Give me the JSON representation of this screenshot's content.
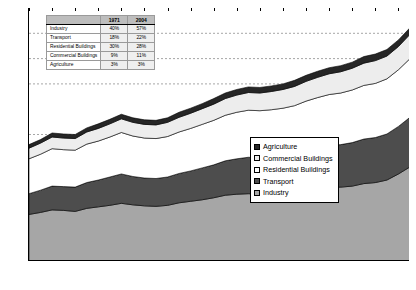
{
  "chart_data": {
    "type": "area",
    "title": "",
    "xlabel": "",
    "ylabel": "Primary Energy (EJ)",
    "ylim": [
      0,
      500
    ],
    "ytick_step": 50,
    "yticks": [
      50,
      100,
      150,
      200,
      250,
      300,
      350,
      400,
      450,
      500
    ],
    "grid": true,
    "gridlines_at": [
      350,
      400,
      450,
      250
    ],
    "legend_position": "center-right",
    "stacked": true,
    "stack_order_bottom_to_top": [
      "Industry",
      "Transport",
      "Residential Buildings",
      "Commercial Buildings",
      "Agriculture"
    ],
    "x": [
      1971,
      1972,
      1973,
      1974,
      1975,
      1976,
      1977,
      1978,
      1979,
      1980,
      1981,
      1982,
      1983,
      1984,
      1985,
      1986,
      1987,
      1988,
      1989,
      1990,
      1991,
      1992,
      1993,
      1994,
      1995,
      1996,
      1997,
      1998,
      1999,
      2000,
      2001,
      2002,
      2003,
      2004
    ],
    "xtick_labels": [
      1971,
      1973,
      1975,
      1977,
      1979,
      1981,
      1983,
      1985,
      1987,
      1989,
      1991,
      1993,
      1995,
      1997,
      1999,
      2001,
      2003
    ],
    "series": [
      {
        "name": "Industry",
        "values": [
          92,
          96,
          101,
          100,
          98,
          104,
          107,
          110,
          114,
          111,
          109,
          108,
          110,
          115,
          118,
          121,
          125,
          130,
          132,
          133,
          132,
          132,
          133,
          135,
          140,
          143,
          146,
          146,
          148,
          153,
          155,
          160,
          172,
          186
        ]
      },
      {
        "name": "Transport",
        "values": [
          41,
          44,
          47,
          47,
          48,
          51,
          53,
          56,
          58,
          56,
          55,
          55,
          56,
          58,
          60,
          63,
          65,
          68,
          70,
          72,
          72,
          73,
          74,
          76,
          78,
          80,
          82,
          84,
          86,
          88,
          89,
          91,
          94,
          98
        ]
      },
      {
        "name": "Residential Buildings",
        "values": [
          69,
          71,
          74,
          73,
          73,
          76,
          77,
          79,
          82,
          80,
          79,
          79,
          80,
          82,
          84,
          86,
          88,
          90,
          92,
          93,
          93,
          94,
          95,
          96,
          98,
          100,
          101,
          102,
          104,
          106,
          107,
          109,
          112,
          116
        ]
      },
      {
        "name": "Commercial Buildings",
        "values": [
          21,
          22,
          23,
          23,
          23,
          24,
          25,
          26,
          27,
          27,
          27,
          27,
          28,
          29,
          30,
          31,
          32,
          33,
          34,
          35,
          35,
          36,
          37,
          38,
          39,
          40,
          41,
          42,
          43,
          44,
          45,
          45,
          46,
          48
        ]
      },
      {
        "name": "Agriculture",
        "values": [
          7,
          7,
          8,
          8,
          8,
          8,
          9,
          9,
          9,
          9,
          9,
          9,
          9,
          10,
          10,
          10,
          11,
          11,
          11,
          11,
          11,
          11,
          11,
          12,
          12,
          12,
          12,
          12,
          12,
          13,
          13,
          13,
          13,
          13
        ]
      }
    ],
    "totals": [
      230,
      240,
      253,
      251,
      250,
      263,
      271,
      280,
      290,
      283,
      279,
      278,
      283,
      294,
      302,
      311,
      321,
      332,
      339,
      344,
      343,
      346,
      350,
      357,
      367,
      375,
      382,
      386,
      393,
      404,
      409,
      418,
      437,
      461
    ],
    "colors": {
      "Industry": "#a6a6a6",
      "Transport": "#4d4d4d",
      "Residential Buildings": "#ffffff",
      "Commercial Buildings": "#ededed",
      "Agriculture": "#262626",
      "grid": "#808080",
      "axis": "#000000"
    }
  },
  "inset_table": {
    "columns": [
      "",
      "1971",
      "2004"
    ],
    "rows": [
      {
        "sector": "Industry",
        "y1971": "40%",
        "y2004": "57%"
      },
      {
        "sector": "Transport",
        "y1971": "18%",
        "y2004": "22%"
      },
      {
        "sector": "Residential Buildings",
        "y1971": "30%",
        "y2004": "28%"
      },
      {
        "sector": "Commercial Buildings",
        "y1971": "9%",
        "y2004": "11%"
      },
      {
        "sector": "Agriculture",
        "y1971": "3%",
        "y2004": "3%"
      }
    ]
  },
  "legend": {
    "items": [
      {
        "label": "Agriculture",
        "color": "#262626"
      },
      {
        "label": "Commercial Buildings",
        "color": "#ededed"
      },
      {
        "label": "Residential Buildings",
        "color": "#ffffff"
      },
      {
        "label": "Transport",
        "color": "#4d4d4d"
      },
      {
        "label": "Industry",
        "color": "#a6a6a6"
      }
    ]
  },
  "axis": {
    "zero_label": "0"
  }
}
